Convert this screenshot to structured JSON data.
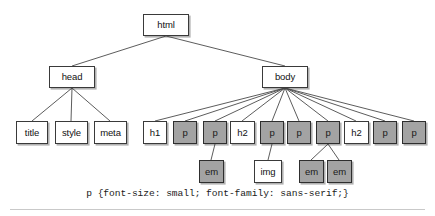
{
  "figure": {
    "type": "tree-diagram",
    "background_color": "#ffffff",
    "shaded_node_color": "#a3a3a3",
    "plain_node_color": "#ffffff",
    "border_color": "#3a3a3a",
    "caption": "p {font-size: small; font-family: sans-serif;}"
  },
  "nodes": [
    {
      "id": "html",
      "label": "html",
      "shaded": false,
      "x": 143,
      "y": 14,
      "w": 46,
      "h": 22
    },
    {
      "id": "head",
      "label": "head",
      "shaded": false,
      "x": 49,
      "y": 66,
      "w": 46,
      "h": 22
    },
    {
      "id": "body",
      "label": "body",
      "shaded": false,
      "x": 262,
      "y": 66,
      "w": 46,
      "h": 22
    },
    {
      "id": "title",
      "label": "title",
      "shaded": false,
      "x": 16,
      "y": 121,
      "w": 32,
      "h": 23
    },
    {
      "id": "style",
      "label": "style",
      "shaded": false,
      "x": 55,
      "y": 121,
      "w": 33,
      "h": 23
    },
    {
      "id": "meta",
      "label": "meta",
      "shaded": false,
      "x": 94,
      "y": 121,
      "w": 33,
      "h": 23
    },
    {
      "id": "h1a",
      "label": "h1",
      "shaded": false,
      "x": 143,
      "y": 121,
      "w": 24,
      "h": 23
    },
    {
      "id": "p1",
      "label": "p",
      "shaded": true,
      "x": 173,
      "y": 121,
      "w": 24,
      "h": 23
    },
    {
      "id": "p2",
      "label": "p",
      "shaded": true,
      "x": 203,
      "y": 121,
      "w": 24,
      "h": 23
    },
    {
      "id": "h2a",
      "label": "h2",
      "shaded": false,
      "x": 230,
      "y": 121,
      "w": 25,
      "h": 23
    },
    {
      "id": "p3",
      "label": "p",
      "shaded": true,
      "x": 260,
      "y": 121,
      "w": 24,
      "h": 23
    },
    {
      "id": "p4",
      "label": "p",
      "shaded": true,
      "x": 287,
      "y": 121,
      "w": 24,
      "h": 23
    },
    {
      "id": "p5",
      "label": "p",
      "shaded": true,
      "x": 316,
      "y": 121,
      "w": 24,
      "h": 23
    },
    {
      "id": "h2b",
      "label": "h2",
      "shaded": false,
      "x": 344,
      "y": 121,
      "w": 25,
      "h": 23
    },
    {
      "id": "p6",
      "label": "p",
      "shaded": true,
      "x": 373,
      "y": 121,
      "w": 24,
      "h": 23
    },
    {
      "id": "p7",
      "label": "p",
      "shaded": true,
      "x": 402,
      "y": 121,
      "w": 24,
      "h": 23
    },
    {
      "id": "em1",
      "label": "em",
      "shaded": true,
      "x": 199,
      "y": 160,
      "w": 25,
      "h": 23
    },
    {
      "id": "img",
      "label": "img",
      "shaded": false,
      "x": 254,
      "y": 160,
      "w": 28,
      "h": 23
    },
    {
      "id": "em2",
      "label": "em",
      "shaded": true,
      "x": 299,
      "y": 160,
      "w": 25,
      "h": 23
    },
    {
      "id": "em3",
      "label": "em",
      "shaded": true,
      "x": 327,
      "y": 160,
      "w": 25,
      "h": 23
    }
  ],
  "edges": [
    {
      "from": "html",
      "to": "head",
      "x1": 166,
      "y1": 36,
      "x2": 72,
      "y2": 66
    },
    {
      "from": "html",
      "to": "body",
      "x1": 166,
      "y1": 36,
      "x2": 285,
      "y2": 66
    },
    {
      "from": "head",
      "to": "title",
      "x1": 72,
      "y1": 88,
      "x2": 32,
      "y2": 121
    },
    {
      "from": "head",
      "to": "style",
      "x1": 72,
      "y1": 88,
      "x2": 71,
      "y2": 121
    },
    {
      "from": "head",
      "to": "meta",
      "x1": 72,
      "y1": 88,
      "x2": 110,
      "y2": 121
    },
    {
      "from": "body",
      "to": "h1a",
      "x1": 285,
      "y1": 88,
      "x2": 155,
      "y2": 121
    },
    {
      "from": "body",
      "to": "p1",
      "x1": 285,
      "y1": 88,
      "x2": 185,
      "y2": 121
    },
    {
      "from": "body",
      "to": "p2",
      "x1": 285,
      "y1": 88,
      "x2": 215,
      "y2": 121
    },
    {
      "from": "body",
      "to": "h2a",
      "x1": 285,
      "y1": 88,
      "x2": 242,
      "y2": 121
    },
    {
      "from": "body",
      "to": "p3",
      "x1": 285,
      "y1": 88,
      "x2": 272,
      "y2": 121
    },
    {
      "from": "body",
      "to": "p4",
      "x1": 285,
      "y1": 88,
      "x2": 299,
      "y2": 121
    },
    {
      "from": "body",
      "to": "p5",
      "x1": 285,
      "y1": 88,
      "x2": 328,
      "y2": 121
    },
    {
      "from": "body",
      "to": "h2b",
      "x1": 285,
      "y1": 88,
      "x2": 356,
      "y2": 121
    },
    {
      "from": "body",
      "to": "p6",
      "x1": 285,
      "y1": 88,
      "x2": 385,
      "y2": 121
    },
    {
      "from": "body",
      "to": "p7",
      "x1": 285,
      "y1": 88,
      "x2": 414,
      "y2": 121
    },
    {
      "from": "p2",
      "to": "em1",
      "x1": 215,
      "y1": 144,
      "x2": 211,
      "y2": 160
    },
    {
      "from": "p3",
      "to": "img",
      "x1": 272,
      "y1": 144,
      "x2": 268,
      "y2": 160
    },
    {
      "from": "p5",
      "to": "em2",
      "x1": 328,
      "y1": 144,
      "x2": 311,
      "y2": 160
    },
    {
      "from": "p5",
      "to": "em3",
      "x1": 328,
      "y1": 144,
      "x2": 339,
      "y2": 160
    }
  ]
}
